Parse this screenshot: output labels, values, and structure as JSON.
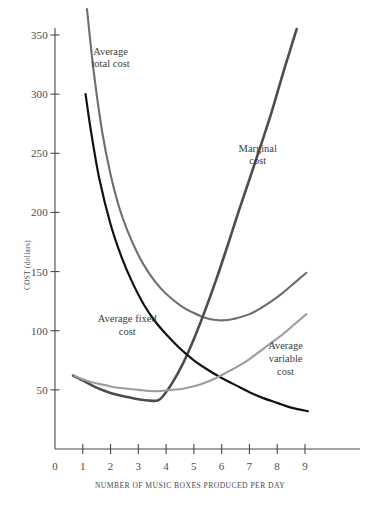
{
  "chart_data": {
    "type": "line",
    "title": "",
    "xlabel": "NUMBER OF MUSIC BOXES PRODUCED PER DAY",
    "ylabel": "COST (dollars)",
    "xlim": [
      0,
      9.6
    ],
    "ylim": [
      0,
      372
    ],
    "grid": false,
    "legend_position": "inline-annotations",
    "xticks": [
      0,
      1,
      2,
      3,
      4,
      5,
      6,
      7,
      8,
      9
    ],
    "xtick_labels": [
      "0",
      "1",
      "2",
      "3",
      "4",
      "5",
      "6",
      "7",
      "8",
      "9"
    ],
    "yticks": [
      50,
      100,
      150,
      200,
      250,
      300,
      350
    ],
    "ytick_labels": [
      "50",
      "100",
      "150",
      "200",
      "250",
      "300",
      "350"
    ],
    "series": [
      {
        "name": "Average total cost",
        "color": "#6e6e6e",
        "x": [
          1.15,
          1.4,
          1.7,
          2.0,
          2.3,
          2.6,
          3.0,
          3.4,
          3.8,
          4.2,
          4.6,
          5.0,
          5.4,
          5.8,
          6.2,
          6.6,
          7.0,
          7.4,
          7.8,
          8.2,
          8.6,
          9.05
        ],
        "y": [
          372,
          318,
          268,
          232,
          205,
          185,
          164,
          148,
          136,
          127,
          120,
          115,
          111,
          109,
          109,
          111,
          114,
          119,
          125,
          132,
          140,
          149
        ]
      },
      {
        "name": "Marginal cost",
        "color": "#4d4d4d",
        "x": [
          0.65,
          1.0,
          1.4,
          1.8,
          2.2,
          2.6,
          3.0,
          3.35,
          3.7,
          3.9,
          4.2,
          4.6,
          5.0,
          5.4,
          5.8,
          6.2,
          6.6,
          7.0,
          7.4,
          7.8,
          8.2,
          8.45,
          8.7
        ],
        "y": [
          62,
          58,
          53,
          49,
          46,
          44,
          42,
          41,
          41,
          45,
          55,
          72,
          93,
          117,
          143,
          171,
          200,
          228,
          256,
          285,
          317,
          336,
          355
        ]
      },
      {
        "name": "Average fixed cost",
        "color": "#111111",
        "x": [
          1.1,
          1.3,
          1.6,
          2.0,
          2.4,
          2.8,
          3.2,
          3.6,
          4.0,
          4.5,
          5.0,
          5.5,
          6.0,
          6.5,
          7.0,
          7.5,
          8.0,
          8.5,
          9.1
        ],
        "y": [
          300,
          268,
          228,
          190,
          162,
          140,
          122,
          108,
          97,
          85,
          75,
          67,
          60,
          54,
          48,
          43,
          39,
          35,
          32
        ]
      },
      {
        "name": "Average variable cost",
        "color": "#9d9d9d",
        "x": [
          0.7,
          1.0,
          1.4,
          1.8,
          2.2,
          2.6,
          3.0,
          3.4,
          3.8,
          4.2,
          4.6,
          5.0,
          5.4,
          5.8,
          6.2,
          6.6,
          7.0,
          7.4,
          7.8,
          8.2,
          8.6,
          9.05
        ],
        "y": [
          62,
          59,
          56,
          54,
          52,
          51,
          50,
          49,
          49,
          50,
          51,
          53,
          56,
          60,
          65,
          70,
          76,
          83,
          90,
          97,
          105,
          114
        ]
      }
    ],
    "annotations": [
      {
        "name": "average-total-cost-label",
        "lines": [
          "Average",
          "total cost"
        ],
        "x": 2.0,
        "y": 330
      },
      {
        "name": "marginal-cost-label",
        "lines": [
          "Marginal",
          "cost"
        ],
        "x": 7.3,
        "y": 248
      },
      {
        "name": "average-fixed-cost-label",
        "lines": [
          "Average fixed",
          "cost"
        ],
        "x": 2.6,
        "y": 104
      },
      {
        "name": "average-variable-cost-label",
        "lines": [
          "Average",
          "variable",
          "cost"
        ],
        "x": 8.3,
        "y": 76
      }
    ]
  }
}
